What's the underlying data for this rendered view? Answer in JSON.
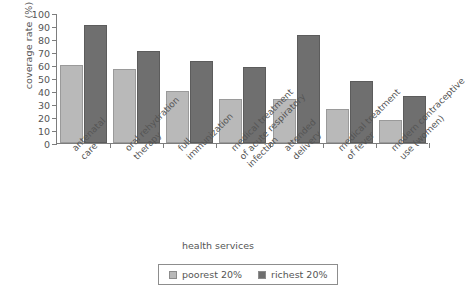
{
  "chart_data": {
    "type": "bar",
    "title": "",
    "xlabel": "health services",
    "ylabel": "coverage rate (%)",
    "ylim": [
      0,
      100
    ],
    "yticks": [
      0,
      10,
      20,
      30,
      40,
      50,
      60,
      70,
      80,
      90,
      100
    ],
    "grid": false,
    "legend_position": "bottom",
    "categories": [
      "antenatal care",
      "oral rehydration therapy",
      "full immunization",
      "medical treatment of acute respiratory infection",
      "attended delivery",
      "medical treatment of fever",
      "modern contraceptive use (women)"
    ],
    "category_lines": [
      [
        "antenatal",
        "care"
      ],
      [
        "oral rehydration",
        "therapy"
      ],
      [
        "full",
        "immunization"
      ],
      [
        "medical treatment",
        "of acute respiratory",
        "infection"
      ],
      [
        "attended",
        "delivery"
      ],
      [
        "medical treatment",
        "of fever"
      ],
      [
        "modern contraceptive",
        "use (women)"
      ]
    ],
    "series": [
      {
        "name": "poorest 20%",
        "color": "#b9b9b9",
        "values": [
          60,
          57,
          40,
          34,
          33.5,
          26,
          18
        ]
      },
      {
        "name": "richest 20%",
        "color": "#6f6f6f",
        "values": [
          91,
          71,
          63,
          58.5,
          83,
          47.5,
          36.5
        ]
      }
    ]
  },
  "legend": {
    "items": [
      {
        "label": "poorest 20%",
        "swatch": "poor"
      },
      {
        "label": "richest 20%",
        "swatch": "rich"
      }
    ]
  }
}
